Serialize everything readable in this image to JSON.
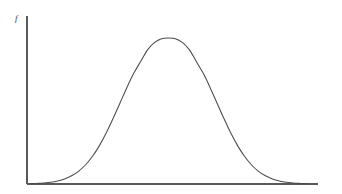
{
  "figure": {
    "background_color": "#ffffff",
    "axis_color": "#595959",
    "curve_color": "#4a4a4a",
    "y_axis_caption": "f"
  },
  "chart_data": {
    "type": "line",
    "title": "",
    "subtitle": "",
    "xlabel": "",
    "ylabel": "f",
    "grid": false,
    "legend": null,
    "annotations": [],
    "axis": {
      "x_axis_pixel_range": [
        27,
        318
      ],
      "y_axis_pixel_range": [
        16,
        184
      ],
      "x_tick_labels": [],
      "y_tick_labels": [],
      "xlim": [
        0,
        10
      ],
      "ylim": [
        0,
        1.15
      ]
    },
    "distribution": {
      "name": "normal",
      "mean_x": 5.0,
      "std_dev_x": 1.23,
      "peak_value_y": 1.0
    },
    "series": [
      {
        "name": "normal density",
        "x": [
          0.0,
          0.25,
          0.5,
          0.75,
          1.0,
          1.25,
          1.5,
          1.75,
          2.0,
          2.25,
          2.5,
          2.75,
          3.0,
          3.25,
          3.5,
          3.75,
          4.0,
          4.25,
          4.5,
          4.75,
          5.0,
          5.25,
          5.5,
          5.75,
          6.0,
          6.25,
          6.5,
          6.75,
          7.0,
          7.25,
          7.5,
          7.75,
          8.0,
          8.25,
          8.5,
          8.75,
          9.0,
          9.25,
          9.5,
          9.75,
          10.0
        ],
        "y": [
          0.002,
          0.004,
          0.007,
          0.012,
          0.021,
          0.035,
          0.056,
          0.087,
          0.13,
          0.188,
          0.261,
          0.349,
          0.449,
          0.555,
          0.661,
          0.759,
          0.84,
          0.92,
          0.969,
          0.995,
          1.0,
          0.995,
          0.969,
          0.92,
          0.84,
          0.759,
          0.661,
          0.555,
          0.449,
          0.349,
          0.261,
          0.188,
          0.13,
          0.087,
          0.056,
          0.035,
          0.021,
          0.012,
          0.007,
          0.004,
          0.002
        ]
      }
    ]
  }
}
